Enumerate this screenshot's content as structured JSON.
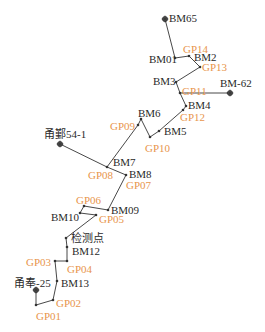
{
  "colors": {
    "line": "#333333",
    "bm_label": "#2a2a2a",
    "gp_label": "#e8954c"
  },
  "route": [
    {
      "id": "BM65",
      "x": 165,
      "y": 19
    },
    {
      "id": "BM01",
      "x": 175,
      "y": 58
    },
    {
      "id": "BM2",
      "x": 189,
      "y": 56
    },
    {
      "id": "GP13",
      "x": 200,
      "y": 67
    },
    {
      "id": "BM3",
      "x": 176,
      "y": 82
    },
    {
      "id": "GP11",
      "x": 180,
      "y": 93
    },
    {
      "id": "BM4",
      "x": 186,
      "y": 106
    },
    {
      "id": "GP12",
      "x": 183,
      "y": 110
    },
    {
      "id": "BM5",
      "x": 159,
      "y": 131
    },
    {
      "id": "GP10",
      "x": 150,
      "y": 137
    },
    {
      "id": "BM6",
      "x": 141,
      "y": 119
    },
    {
      "id": "GP09",
      "x": 138,
      "y": 125
    },
    {
      "id": "BM7",
      "x": 107,
      "y": 167
    },
    {
      "id": "BM8",
      "x": 126,
      "y": 175
    },
    {
      "id": "BM09",
      "x": 108,
      "y": 210
    },
    {
      "id": "GP06",
      "x": 84,
      "y": 206
    },
    {
      "id": "BM10",
      "x": 80,
      "y": 213
    },
    {
      "id": "GP05",
      "x": 96,
      "y": 215
    },
    {
      "id": "检测点",
      "x": 66,
      "y": 238
    },
    {
      "id": "BM12",
      "x": 67,
      "y": 247
    },
    {
      "id": "GP04",
      "x": 67,
      "y": 261
    },
    {
      "id": "GP03",
      "x": 55,
      "y": 261
    },
    {
      "id": "BM13",
      "x": 57,
      "y": 281
    },
    {
      "id": "GP02",
      "x": 53,
      "y": 300
    },
    {
      "id": "GP01",
      "x": 36,
      "y": 305
    },
    {
      "id": "甬奉-25",
      "x": 36,
      "y": 290
    }
  ],
  "branches": [
    {
      "from": {
        "x": 180,
        "y": 93
      },
      "to": {
        "x": 230,
        "y": 93
      },
      "label": "BM-62"
    },
    {
      "from": {
        "x": 107,
        "y": 167
      },
      "to": {
        "x": 60,
        "y": 144
      },
      "label": "甬鄞54-1"
    }
  ],
  "labels": [
    {
      "text": "BM65",
      "x": 169,
      "y": 13,
      "type": "bm"
    },
    {
      "text": "GP14",
      "x": 183,
      "y": 44,
      "type": "gp"
    },
    {
      "text": "BM01",
      "x": 149,
      "y": 54,
      "type": "bm"
    },
    {
      "text": "BM2",
      "x": 194,
      "y": 52,
      "type": "bm"
    },
    {
      "text": "GP13",
      "x": 202,
      "y": 62,
      "type": "gp"
    },
    {
      "text": "BM3",
      "x": 153,
      "y": 76,
      "type": "bm"
    },
    {
      "text": "GP11",
      "x": 182,
      "y": 86,
      "type": "gp"
    },
    {
      "text": "BM-62",
      "x": 220,
      "y": 78,
      "type": "bm"
    },
    {
      "text": "BM4",
      "x": 188,
      "y": 100,
      "type": "bm"
    },
    {
      "text": "GP12",
      "x": 180,
      "y": 112,
      "type": "gp"
    },
    {
      "text": "BM6",
      "x": 138,
      "y": 108,
      "type": "bm"
    },
    {
      "text": "GP09",
      "x": 110,
      "y": 121,
      "type": "gp"
    },
    {
      "text": "BM5",
      "x": 164,
      "y": 126,
      "type": "bm"
    },
    {
      "text": "GP10",
      "x": 145,
      "y": 143,
      "type": "gp"
    },
    {
      "text": "甬鄞54-1",
      "x": 44,
      "y": 129,
      "type": "bm"
    },
    {
      "text": "BM7",
      "x": 113,
      "y": 157,
      "type": "bm"
    },
    {
      "text": "GP08",
      "x": 88,
      "y": 170,
      "type": "gp"
    },
    {
      "text": "BM8",
      "x": 129,
      "y": 169,
      "type": "bm"
    },
    {
      "text": "GP07",
      "x": 126,
      "y": 180,
      "type": "gp"
    },
    {
      "text": "GP06",
      "x": 76,
      "y": 195,
      "type": "gp"
    },
    {
      "text": "BM09",
      "x": 111,
      "y": 205,
      "type": "bm"
    },
    {
      "text": "BM10",
      "x": 51,
      "y": 212,
      "type": "bm"
    },
    {
      "text": "GP05",
      "x": 99,
      "y": 214,
      "type": "gp"
    },
    {
      "text": "检测点",
      "x": 71,
      "y": 233,
      "type": "bm"
    },
    {
      "text": "BM12",
      "x": 72,
      "y": 246,
      "type": "bm"
    },
    {
      "text": "GP03",
      "x": 26,
      "y": 257,
      "type": "gp"
    },
    {
      "text": "GP04",
      "x": 67,
      "y": 264,
      "type": "gp"
    },
    {
      "text": "甬奉-25",
      "x": 14,
      "y": 278,
      "type": "bm"
    },
    {
      "text": "BM13",
      "x": 61,
      "y": 278,
      "type": "bm"
    },
    {
      "text": "GP02",
      "x": 56,
      "y": 298,
      "type": "gp"
    },
    {
      "text": "GP01",
      "x": 36,
      "y": 311,
      "type": "gp"
    }
  ],
  "control_markers": [
    {
      "id": "BM65",
      "x": 165,
      "y": 19
    },
    {
      "id": "BM-62",
      "x": 230,
      "y": 93
    },
    {
      "id": "甬鄞54-1",
      "x": 60,
      "y": 144
    },
    {
      "id": "甬奉-25",
      "x": 36,
      "y": 290
    }
  ]
}
